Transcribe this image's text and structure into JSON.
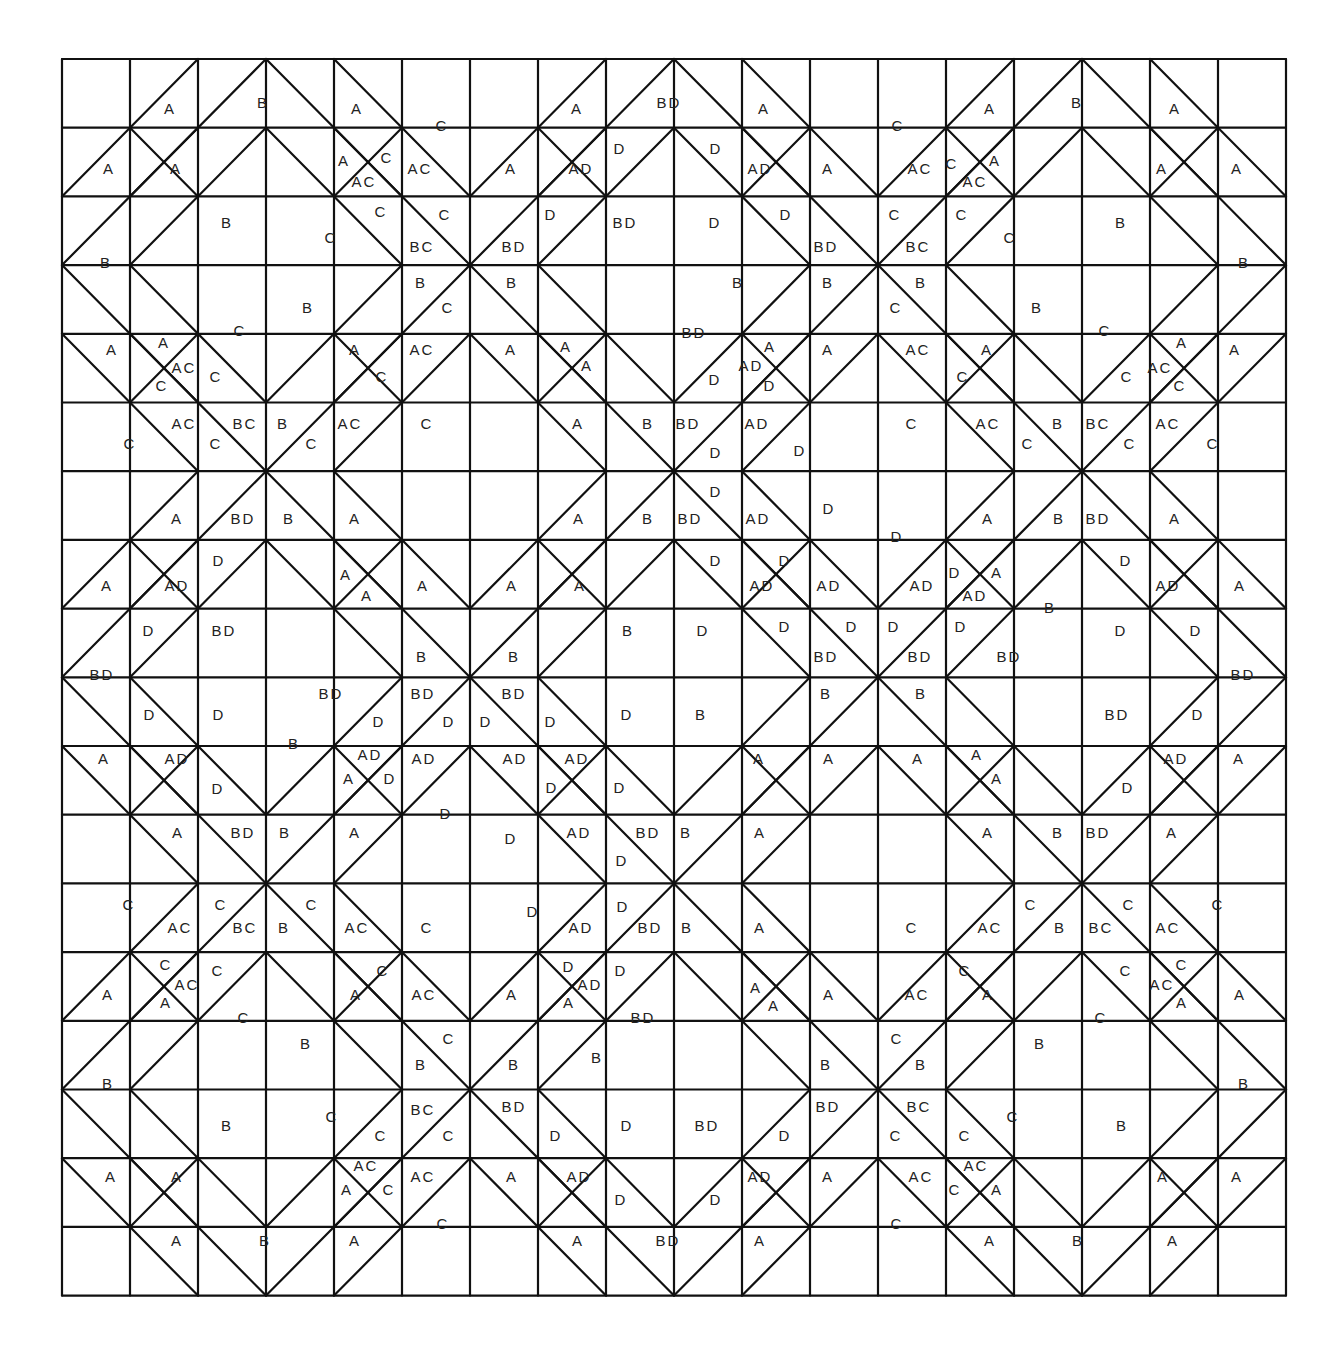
{
  "diagram": {
    "type": "quilt-block-pattern",
    "grid": {
      "cols": 18,
      "rows": 18,
      "x0": 62,
      "y0": 59,
      "cell_w": 68,
      "cell_h": 68.7
    },
    "line_color": "#111111",
    "background": "#ffffff",
    "legend_values": [
      "A",
      "B",
      "C",
      "D",
      "AC",
      "AD",
      "BC",
      "BD"
    ]
  },
  "labels": [
    {
      "t": "A",
      "x": 170,
      "y": 110
    },
    {
      "t": "B",
      "x": 263,
      "y": 104
    },
    {
      "t": "A",
      "x": 357,
      "y": 110
    },
    {
      "t": "C",
      "x": 442,
      "y": 127
    },
    {
      "t": "A",
      "x": 577,
      "y": 110
    },
    {
      "t": "BD",
      "x": 669,
      "y": 104
    },
    {
      "t": "A",
      "x": 764,
      "y": 110
    },
    {
      "t": "C",
      "x": 898,
      "y": 127
    },
    {
      "t": "A",
      "x": 990,
      "y": 110
    },
    {
      "t": "B",
      "x": 1077,
      "y": 104
    },
    {
      "t": "A",
      "x": 1175,
      "y": 110
    },
    {
      "t": "A",
      "x": 109,
      "y": 170
    },
    {
      "t": "A",
      "x": 176,
      "y": 170
    },
    {
      "t": "A",
      "x": 344,
      "y": 162
    },
    {
      "t": "C",
      "x": 387,
      "y": 159
    },
    {
      "t": "AC",
      "x": 364,
      "y": 183
    },
    {
      "t": "AC",
      "x": 420,
      "y": 170
    },
    {
      "t": "A",
      "x": 511,
      "y": 170
    },
    {
      "t": "AD",
      "x": 581,
      "y": 170
    },
    {
      "t": "D",
      "x": 620,
      "y": 150
    },
    {
      "t": "D",
      "x": 716,
      "y": 150
    },
    {
      "t": "AD",
      "x": 760,
      "y": 170
    },
    {
      "t": "A",
      "x": 828,
      "y": 170
    },
    {
      "t": "AC",
      "x": 920,
      "y": 170
    },
    {
      "t": "C",
      "x": 952,
      "y": 165
    },
    {
      "t": "A",
      "x": 995,
      "y": 162
    },
    {
      "t": "AC",
      "x": 975,
      "y": 183
    },
    {
      "t": "A",
      "x": 1162,
      "y": 170
    },
    {
      "t": "A",
      "x": 1237,
      "y": 170
    },
    {
      "t": "B",
      "x": 227,
      "y": 224
    },
    {
      "t": "C",
      "x": 331,
      "y": 239
    },
    {
      "t": "C",
      "x": 381,
      "y": 213
    },
    {
      "t": "C",
      "x": 445,
      "y": 216
    },
    {
      "t": "BC",
      "x": 422,
      "y": 248
    },
    {
      "t": "D",
      "x": 551,
      "y": 216
    },
    {
      "t": "BD",
      "x": 625,
      "y": 224
    },
    {
      "t": "D",
      "x": 715,
      "y": 224
    },
    {
      "t": "D",
      "x": 786,
      "y": 216
    },
    {
      "t": "BD",
      "x": 514,
      "y": 248
    },
    {
      "t": "BD",
      "x": 826,
      "y": 248
    },
    {
      "t": "C",
      "x": 895,
      "y": 216
    },
    {
      "t": "BC",
      "x": 918,
      "y": 248
    },
    {
      "t": "C",
      "x": 962,
      "y": 216
    },
    {
      "t": "C",
      "x": 1010,
      "y": 239
    },
    {
      "t": "B",
      "x": 1121,
      "y": 224
    },
    {
      "t": "B",
      "x": 106,
      "y": 264
    },
    {
      "t": "B",
      "x": 1244,
      "y": 264
    },
    {
      "t": "B",
      "x": 421,
      "y": 284
    },
    {
      "t": "C",
      "x": 448,
      "y": 309
    },
    {
      "t": "B",
      "x": 308,
      "y": 309
    },
    {
      "t": "C",
      "x": 240,
      "y": 332
    },
    {
      "t": "B",
      "x": 512,
      "y": 284
    },
    {
      "t": "B",
      "x": 738,
      "y": 284
    },
    {
      "t": "B",
      "x": 828,
      "y": 284
    },
    {
      "t": "BD",
      "x": 694,
      "y": 334
    },
    {
      "t": "B",
      "x": 921,
      "y": 284
    },
    {
      "t": "C",
      "x": 896,
      "y": 309
    },
    {
      "t": "B",
      "x": 1037,
      "y": 309
    },
    {
      "t": "C",
      "x": 1105,
      "y": 332
    },
    {
      "t": "A",
      "x": 112,
      "y": 351
    },
    {
      "t": "A",
      "x": 164,
      "y": 344
    },
    {
      "t": "AC",
      "x": 184,
      "y": 369
    },
    {
      "t": "C",
      "x": 162,
      "y": 387
    },
    {
      "t": "C",
      "x": 216,
      "y": 378
    },
    {
      "t": "A",
      "x": 355,
      "y": 351
    },
    {
      "t": "C",
      "x": 382,
      "y": 378
    },
    {
      "t": "AC",
      "x": 422,
      "y": 351
    },
    {
      "t": "A",
      "x": 511,
      "y": 351
    },
    {
      "t": "A",
      "x": 566,
      "y": 348
    },
    {
      "t": "A",
      "x": 587,
      "y": 367
    },
    {
      "t": "A",
      "x": 770,
      "y": 348
    },
    {
      "t": "AD",
      "x": 751,
      "y": 367
    },
    {
      "t": "D",
      "x": 770,
      "y": 387
    },
    {
      "t": "D",
      "x": 715,
      "y": 381
    },
    {
      "t": "A",
      "x": 828,
      "y": 351
    },
    {
      "t": "AC",
      "x": 918,
      "y": 351
    },
    {
      "t": "A",
      "x": 987,
      "y": 351
    },
    {
      "t": "C",
      "x": 963,
      "y": 378
    },
    {
      "t": "C",
      "x": 1127,
      "y": 378
    },
    {
      "t": "A",
      "x": 1182,
      "y": 344
    },
    {
      "t": "AC",
      "x": 1160,
      "y": 369
    },
    {
      "t": "C",
      "x": 1180,
      "y": 387
    },
    {
      "t": "A",
      "x": 1235,
      "y": 351
    },
    {
      "t": "C",
      "x": 130,
      "y": 445
    },
    {
      "t": "AC",
      "x": 184,
      "y": 425
    },
    {
      "t": "C",
      "x": 216,
      "y": 445
    },
    {
      "t": "BC",
      "x": 245,
      "y": 425
    },
    {
      "t": "B",
      "x": 283,
      "y": 425
    },
    {
      "t": "C",
      "x": 312,
      "y": 445
    },
    {
      "t": "AC",
      "x": 350,
      "y": 425
    },
    {
      "t": "C",
      "x": 427,
      "y": 425
    },
    {
      "t": "A",
      "x": 578,
      "y": 425
    },
    {
      "t": "B",
      "x": 648,
      "y": 425
    },
    {
      "t": "BD",
      "x": 688,
      "y": 425
    },
    {
      "t": "D",
      "x": 716,
      "y": 454
    },
    {
      "t": "AD",
      "x": 757,
      "y": 425
    },
    {
      "t": "D",
      "x": 800,
      "y": 452
    },
    {
      "t": "C",
      "x": 912,
      "y": 425
    },
    {
      "t": "AC",
      "x": 988,
      "y": 425
    },
    {
      "t": "C",
      "x": 1028,
      "y": 445
    },
    {
      "t": "B",
      "x": 1058,
      "y": 425
    },
    {
      "t": "BC",
      "x": 1098,
      "y": 425
    },
    {
      "t": "C",
      "x": 1130,
      "y": 445
    },
    {
      "t": "AC",
      "x": 1168,
      "y": 425
    },
    {
      "t": "C",
      "x": 1213,
      "y": 445
    },
    {
      "t": "D",
      "x": 716,
      "y": 493
    },
    {
      "t": "D",
      "x": 829,
      "y": 510
    },
    {
      "t": "D",
      "x": 897,
      "y": 538
    },
    {
      "t": "A",
      "x": 177,
      "y": 520
    },
    {
      "t": "BD",
      "x": 243,
      "y": 520
    },
    {
      "t": "B",
      "x": 289,
      "y": 520
    },
    {
      "t": "A",
      "x": 355,
      "y": 520
    },
    {
      "t": "A",
      "x": 579,
      "y": 520
    },
    {
      "t": "B",
      "x": 648,
      "y": 520
    },
    {
      "t": "BD",
      "x": 690,
      "y": 520
    },
    {
      "t": "AD",
      "x": 758,
      "y": 520
    },
    {
      "t": "A",
      "x": 988,
      "y": 520
    },
    {
      "t": "B",
      "x": 1059,
      "y": 520
    },
    {
      "t": "BD",
      "x": 1098,
      "y": 520
    },
    {
      "t": "A",
      "x": 1175,
      "y": 520
    },
    {
      "t": "D",
      "x": 219,
      "y": 562
    },
    {
      "t": "A",
      "x": 107,
      "y": 587
    },
    {
      "t": "AD",
      "x": 177,
      "y": 587
    },
    {
      "t": "A",
      "x": 346,
      "y": 576
    },
    {
      "t": "A",
      "x": 367,
      "y": 597
    },
    {
      "t": "A",
      "x": 423,
      "y": 587
    },
    {
      "t": "A",
      "x": 512,
      "y": 587
    },
    {
      "t": "A",
      "x": 580,
      "y": 587
    },
    {
      "t": "D",
      "x": 716,
      "y": 562
    },
    {
      "t": "D",
      "x": 785,
      "y": 562
    },
    {
      "t": "AD",
      "x": 762,
      "y": 587
    },
    {
      "t": "AD",
      "x": 829,
      "y": 587
    },
    {
      "t": "AD",
      "x": 922,
      "y": 587
    },
    {
      "t": "D",
      "x": 955,
      "y": 574
    },
    {
      "t": "A",
      "x": 997,
      "y": 574
    },
    {
      "t": "AD",
      "x": 975,
      "y": 597
    },
    {
      "t": "D",
      "x": 1126,
      "y": 562
    },
    {
      "t": "AD",
      "x": 1168,
      "y": 587
    },
    {
      "t": "A",
      "x": 1240,
      "y": 587
    },
    {
      "t": "D",
      "x": 149,
      "y": 632
    },
    {
      "t": "BD",
      "x": 224,
      "y": 632
    },
    {
      "t": "B",
      "x": 628,
      "y": 632
    },
    {
      "t": "D",
      "x": 703,
      "y": 632
    },
    {
      "t": "D",
      "x": 785,
      "y": 628
    },
    {
      "t": "D",
      "x": 852,
      "y": 628
    },
    {
      "t": "D",
      "x": 894,
      "y": 628
    },
    {
      "t": "D",
      "x": 961,
      "y": 628
    },
    {
      "t": "B",
      "x": 1050,
      "y": 609
    },
    {
      "t": "D",
      "x": 1121,
      "y": 632
    },
    {
      "t": "D",
      "x": 1196,
      "y": 632
    },
    {
      "t": "B",
      "x": 422,
      "y": 658
    },
    {
      "t": "B",
      "x": 514,
      "y": 658
    },
    {
      "t": "BD",
      "x": 826,
      "y": 658
    },
    {
      "t": "BD",
      "x": 920,
      "y": 658
    },
    {
      "t": "BD",
      "x": 1009,
      "y": 658
    },
    {
      "t": "BD",
      "x": 102,
      "y": 676
    },
    {
      "t": "BD",
      "x": 1243,
      "y": 676
    },
    {
      "t": "BD",
      "x": 331,
      "y": 695
    },
    {
      "t": "BD",
      "x": 423,
      "y": 695
    },
    {
      "t": "BD",
      "x": 514,
      "y": 695
    },
    {
      "t": "B",
      "x": 826,
      "y": 695
    },
    {
      "t": "B",
      "x": 921,
      "y": 695
    },
    {
      "t": "D",
      "x": 150,
      "y": 716
    },
    {
      "t": "D",
      "x": 219,
      "y": 716
    },
    {
      "t": "D",
      "x": 379,
      "y": 723
    },
    {
      "t": "D",
      "x": 449,
      "y": 723
    },
    {
      "t": "D",
      "x": 486,
      "y": 723
    },
    {
      "t": "D",
      "x": 551,
      "y": 723
    },
    {
      "t": "D",
      "x": 627,
      "y": 716
    },
    {
      "t": "B",
      "x": 701,
      "y": 716
    },
    {
      "t": "BD",
      "x": 1117,
      "y": 716
    },
    {
      "t": "D",
      "x": 1198,
      "y": 716
    },
    {
      "t": "B",
      "x": 294,
      "y": 745
    },
    {
      "t": "A",
      "x": 104,
      "y": 760
    },
    {
      "t": "AD",
      "x": 177,
      "y": 760
    },
    {
      "t": "AD",
      "x": 370,
      "y": 756
    },
    {
      "t": "A",
      "x": 349,
      "y": 780
    },
    {
      "t": "D",
      "x": 390,
      "y": 780
    },
    {
      "t": "AD",
      "x": 424,
      "y": 760
    },
    {
      "t": "AD",
      "x": 515,
      "y": 760
    },
    {
      "t": "AD",
      "x": 577,
      "y": 760
    },
    {
      "t": "A",
      "x": 759,
      "y": 760
    },
    {
      "t": "A",
      "x": 829,
      "y": 760
    },
    {
      "t": "A",
      "x": 918,
      "y": 760
    },
    {
      "t": "A",
      "x": 977,
      "y": 756
    },
    {
      "t": "A",
      "x": 997,
      "y": 780
    },
    {
      "t": "AD",
      "x": 1176,
      "y": 760
    },
    {
      "t": "A",
      "x": 1239,
      "y": 760
    },
    {
      "t": "D",
      "x": 218,
      "y": 790
    },
    {
      "t": "D",
      "x": 446,
      "y": 815
    },
    {
      "t": "D",
      "x": 552,
      "y": 789
    },
    {
      "t": "D",
      "x": 620,
      "y": 789
    },
    {
      "t": "D",
      "x": 1128,
      "y": 789
    },
    {
      "t": "A",
      "x": 178,
      "y": 834
    },
    {
      "t": "BD",
      "x": 243,
      "y": 834
    },
    {
      "t": "B",
      "x": 285,
      "y": 834
    },
    {
      "t": "A",
      "x": 355,
      "y": 834
    },
    {
      "t": "D",
      "x": 511,
      "y": 840
    },
    {
      "t": "AD",
      "x": 579,
      "y": 834
    },
    {
      "t": "BD",
      "x": 648,
      "y": 834
    },
    {
      "t": "D",
      "x": 622,
      "y": 862
    },
    {
      "t": "B",
      "x": 686,
      "y": 834
    },
    {
      "t": "A",
      "x": 760,
      "y": 834
    },
    {
      "t": "A",
      "x": 988,
      "y": 834
    },
    {
      "t": "B",
      "x": 1058,
      "y": 834
    },
    {
      "t": "BD",
      "x": 1098,
      "y": 834
    },
    {
      "t": "A",
      "x": 1172,
      "y": 834
    },
    {
      "t": "C",
      "x": 129,
      "y": 906
    },
    {
      "t": "AC",
      "x": 180,
      "y": 929
    },
    {
      "t": "C",
      "x": 221,
      "y": 906
    },
    {
      "t": "BC",
      "x": 245,
      "y": 929
    },
    {
      "t": "B",
      "x": 284,
      "y": 929
    },
    {
      "t": "C",
      "x": 312,
      "y": 906
    },
    {
      "t": "AC",
      "x": 357,
      "y": 929
    },
    {
      "t": "C",
      "x": 427,
      "y": 929
    },
    {
      "t": "D",
      "x": 533,
      "y": 913
    },
    {
      "t": "D",
      "x": 623,
      "y": 908
    },
    {
      "t": "AD",
      "x": 581,
      "y": 929
    },
    {
      "t": "BD",
      "x": 650,
      "y": 929
    },
    {
      "t": "B",
      "x": 687,
      "y": 929
    },
    {
      "t": "A",
      "x": 760,
      "y": 929
    },
    {
      "t": "C",
      "x": 912,
      "y": 929
    },
    {
      "t": "AC",
      "x": 990,
      "y": 929
    },
    {
      "t": "C",
      "x": 1031,
      "y": 906
    },
    {
      "t": "B",
      "x": 1060,
      "y": 929
    },
    {
      "t": "BC",
      "x": 1101,
      "y": 929
    },
    {
      "t": "C",
      "x": 1129,
      "y": 906
    },
    {
      "t": "AC",
      "x": 1168,
      "y": 929
    },
    {
      "t": "C",
      "x": 1218,
      "y": 906
    },
    {
      "t": "C",
      "x": 166,
      "y": 966
    },
    {
      "t": "AC",
      "x": 187,
      "y": 986
    },
    {
      "t": "A",
      "x": 166,
      "y": 1004
    },
    {
      "t": "C",
      "x": 218,
      "y": 972
    },
    {
      "t": "A",
      "x": 108,
      "y": 996
    },
    {
      "t": "C",
      "x": 244,
      "y": 1019
    },
    {
      "t": "C",
      "x": 383,
      "y": 972
    },
    {
      "t": "A",
      "x": 356,
      "y": 996
    },
    {
      "t": "AC",
      "x": 424,
      "y": 996
    },
    {
      "t": "A",
      "x": 512,
      "y": 996
    },
    {
      "t": "D",
      "x": 569,
      "y": 968
    },
    {
      "t": "AD",
      "x": 590,
      "y": 986
    },
    {
      "t": "A",
      "x": 569,
      "y": 1004
    },
    {
      "t": "D",
      "x": 621,
      "y": 972
    },
    {
      "t": "BD",
      "x": 643,
      "y": 1019
    },
    {
      "t": "A",
      "x": 756,
      "y": 989
    },
    {
      "t": "A",
      "x": 774,
      "y": 1007
    },
    {
      "t": "A",
      "x": 829,
      "y": 996
    },
    {
      "t": "AC",
      "x": 917,
      "y": 996
    },
    {
      "t": "C",
      "x": 965,
      "y": 972
    },
    {
      "t": "A",
      "x": 988,
      "y": 996
    },
    {
      "t": "C",
      "x": 1126,
      "y": 972
    },
    {
      "t": "C",
      "x": 1182,
      "y": 966
    },
    {
      "t": "AC",
      "x": 1162,
      "y": 986
    },
    {
      "t": "A",
      "x": 1182,
      "y": 1004
    },
    {
      "t": "A",
      "x": 1240,
      "y": 996
    },
    {
      "t": "B",
      "x": 306,
      "y": 1045
    },
    {
      "t": "C",
      "x": 449,
      "y": 1040
    },
    {
      "t": "B",
      "x": 421,
      "y": 1066
    },
    {
      "t": "B",
      "x": 514,
      "y": 1066
    },
    {
      "t": "B",
      "x": 597,
      "y": 1059
    },
    {
      "t": "B",
      "x": 826,
      "y": 1066
    },
    {
      "t": "C",
      "x": 897,
      "y": 1040
    },
    {
      "t": "B",
      "x": 921,
      "y": 1066
    },
    {
      "t": "B",
      "x": 1040,
      "y": 1045
    },
    {
      "t": "C",
      "x": 1101,
      "y": 1019
    },
    {
      "t": "B",
      "x": 108,
      "y": 1085
    },
    {
      "t": "B",
      "x": 1244,
      "y": 1085
    },
    {
      "t": "B",
      "x": 227,
      "y": 1127
    },
    {
      "t": "C",
      "x": 332,
      "y": 1118
    },
    {
      "t": "C",
      "x": 381,
      "y": 1137
    },
    {
      "t": "BC",
      "x": 423,
      "y": 1111
    },
    {
      "t": "C",
      "x": 449,
      "y": 1137
    },
    {
      "t": "BD",
      "x": 514,
      "y": 1108
    },
    {
      "t": "D",
      "x": 556,
      "y": 1137
    },
    {
      "t": "D",
      "x": 627,
      "y": 1127
    },
    {
      "t": "BD",
      "x": 707,
      "y": 1127
    },
    {
      "t": "D",
      "x": 785,
      "y": 1137
    },
    {
      "t": "BD",
      "x": 828,
      "y": 1108
    },
    {
      "t": "BC",
      "x": 919,
      "y": 1108
    },
    {
      "t": "C",
      "x": 896,
      "y": 1137
    },
    {
      "t": "C",
      "x": 965,
      "y": 1137
    },
    {
      "t": "C",
      "x": 1013,
      "y": 1118
    },
    {
      "t": "B",
      "x": 1122,
      "y": 1127
    },
    {
      "t": "A",
      "x": 111,
      "y": 1178
    },
    {
      "t": "A",
      "x": 177,
      "y": 1178
    },
    {
      "t": "AC",
      "x": 366,
      "y": 1167
    },
    {
      "t": "A",
      "x": 347,
      "y": 1191
    },
    {
      "t": "C",
      "x": 389,
      "y": 1191
    },
    {
      "t": "AC",
      "x": 423,
      "y": 1178
    },
    {
      "t": "A",
      "x": 512,
      "y": 1178
    },
    {
      "t": "AD",
      "x": 579,
      "y": 1178
    },
    {
      "t": "D",
      "x": 621,
      "y": 1201
    },
    {
      "t": "D",
      "x": 716,
      "y": 1201
    },
    {
      "t": "AD",
      "x": 760,
      "y": 1178
    },
    {
      "t": "A",
      "x": 828,
      "y": 1178
    },
    {
      "t": "AC",
      "x": 921,
      "y": 1178
    },
    {
      "t": "AC",
      "x": 976,
      "y": 1167
    },
    {
      "t": "C",
      "x": 955,
      "y": 1191
    },
    {
      "t": "A",
      "x": 997,
      "y": 1191
    },
    {
      "t": "A",
      "x": 1163,
      "y": 1178
    },
    {
      "t": "A",
      "x": 1237,
      "y": 1178
    },
    {
      "t": "A",
      "x": 177,
      "y": 1242
    },
    {
      "t": "B",
      "x": 265,
      "y": 1242
    },
    {
      "t": "A",
      "x": 355,
      "y": 1242
    },
    {
      "t": "C",
      "x": 443,
      "y": 1225
    },
    {
      "t": "A",
      "x": 578,
      "y": 1242
    },
    {
      "t": "BD",
      "x": 668,
      "y": 1242
    },
    {
      "t": "A",
      "x": 760,
      "y": 1242
    },
    {
      "t": "C",
      "x": 897,
      "y": 1225
    },
    {
      "t": "A",
      "x": 990,
      "y": 1242
    },
    {
      "t": "B",
      "x": 1078,
      "y": 1242
    },
    {
      "t": "A",
      "x": 1173,
      "y": 1242
    }
  ]
}
